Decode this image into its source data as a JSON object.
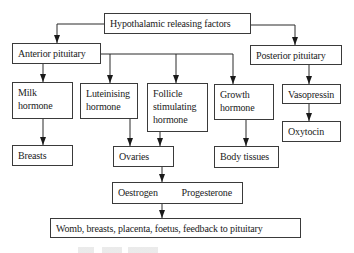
{
  "diagram": {
    "type": "flowchart",
    "title": "Hypothalamic releasing factors",
    "nodes": {
      "hypothalamic": {
        "label": "Hypothalamic releasing factors"
      },
      "anterior": {
        "label": "Anterior pituitary"
      },
      "posterior": {
        "label": "Posterior pituitary"
      },
      "milk": {
        "line1": "Milk",
        "line2": "hormone"
      },
      "lh": {
        "line1": "Luteinising",
        "line2": "hormone"
      },
      "fsh": {
        "line1": "Follicle",
        "line2": "stimulating",
        "line3": "hormone"
      },
      "growth": {
        "line1": "Growth",
        "line2": "hormone"
      },
      "vasopressin": {
        "label": "Vasopressin"
      },
      "oxytocin": {
        "label": "Oxytocin"
      },
      "breasts": {
        "label": "Breasts"
      },
      "ovaries": {
        "label": "Ovaries"
      },
      "body_tissues": {
        "label": "Body tissues"
      },
      "sex_hormones": {
        "left": "Oestrogen",
        "right": "Progesterone"
      },
      "targets": {
        "label": "Womb, breasts, placenta, foetus, feedback to pituitary"
      }
    },
    "edges": [
      [
        "hypothalamic",
        "anterior"
      ],
      [
        "hypothalamic",
        "posterior"
      ],
      [
        "anterior",
        "milk"
      ],
      [
        "anterior",
        "lh"
      ],
      [
        "anterior",
        "fsh"
      ],
      [
        "anterior",
        "growth"
      ],
      [
        "posterior",
        "vasopressin"
      ],
      [
        "vasopressin",
        "oxytocin"
      ],
      [
        "milk",
        "breasts"
      ],
      [
        "lh",
        "ovaries"
      ],
      [
        "fsh",
        "ovaries"
      ],
      [
        "growth",
        "body_tissues"
      ],
      [
        "ovaries",
        "sex_hormones"
      ],
      [
        "sex_hormones",
        "targets"
      ]
    ],
    "colors": {
      "line": "#2a2a2a",
      "box_border": "#3a3a3a",
      "background": "#ffffff"
    }
  }
}
